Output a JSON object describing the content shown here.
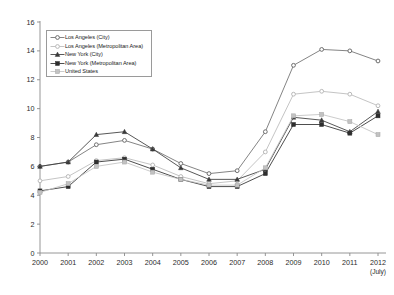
{
  "chart_data": {
    "type": "line",
    "title": "",
    "subtitle": "",
    "xlabel": "",
    "ylabel": "",
    "xlim": [
      2000,
      2012
    ],
    "ylim": [
      0,
      16
    ],
    "ytick_step": 2,
    "grid": false,
    "legend_position": "top-left",
    "x_axis_note": "(July)",
    "categories": [
      "2000",
      "2001",
      "2002",
      "2003",
      "2004",
      "2005",
      "2006",
      "2007",
      "2008",
      "2009",
      "2010",
      "2011",
      "2012"
    ],
    "yticks": [
      "0",
      "2",
      "4",
      "6",
      "8",
      "10",
      "12",
      "14",
      "16"
    ],
    "series": [
      {
        "name": "Los Angeles (City)",
        "marker": "circle-open",
        "color": "#6e6e6e",
        "values": [
          6.0,
          6.3,
          7.5,
          7.8,
          7.2,
          6.2,
          5.5,
          5.7,
          8.4,
          13.0,
          14.1,
          14.0,
          13.3
        ]
      },
      {
        "name": "Los Angeles (Metropolitan Area)",
        "marker": "circle-open-light",
        "color": "#b9b9b9",
        "values": [
          5.0,
          5.3,
          6.4,
          6.6,
          6.1,
          5.3,
          4.8,
          5.0,
          7.0,
          11.0,
          11.2,
          11.0,
          10.2
        ]
      },
      {
        "name": "New York (City)",
        "marker": "triangle-filled",
        "color": "#3a3a3a",
        "values": [
          6.0,
          6.3,
          8.2,
          8.4,
          7.2,
          5.9,
          5.1,
          5.1,
          5.8,
          9.4,
          9.2,
          8.4,
          9.8
        ]
      },
      {
        "name": "New York (Metropolitan Area)",
        "marker": "square-filled",
        "color": "#2e2e2e",
        "values": [
          4.3,
          4.6,
          6.3,
          6.5,
          5.8,
          5.1,
          4.6,
          4.6,
          5.5,
          8.9,
          8.9,
          8.3,
          9.5
        ]
      },
      {
        "name": "United States",
        "marker": "square-light",
        "color": "#c2c2c2",
        "values": [
          4.2,
          4.8,
          6.0,
          6.3,
          5.6,
          5.1,
          4.7,
          4.7,
          5.9,
          9.5,
          9.6,
          9.1,
          8.2
        ]
      }
    ]
  }
}
